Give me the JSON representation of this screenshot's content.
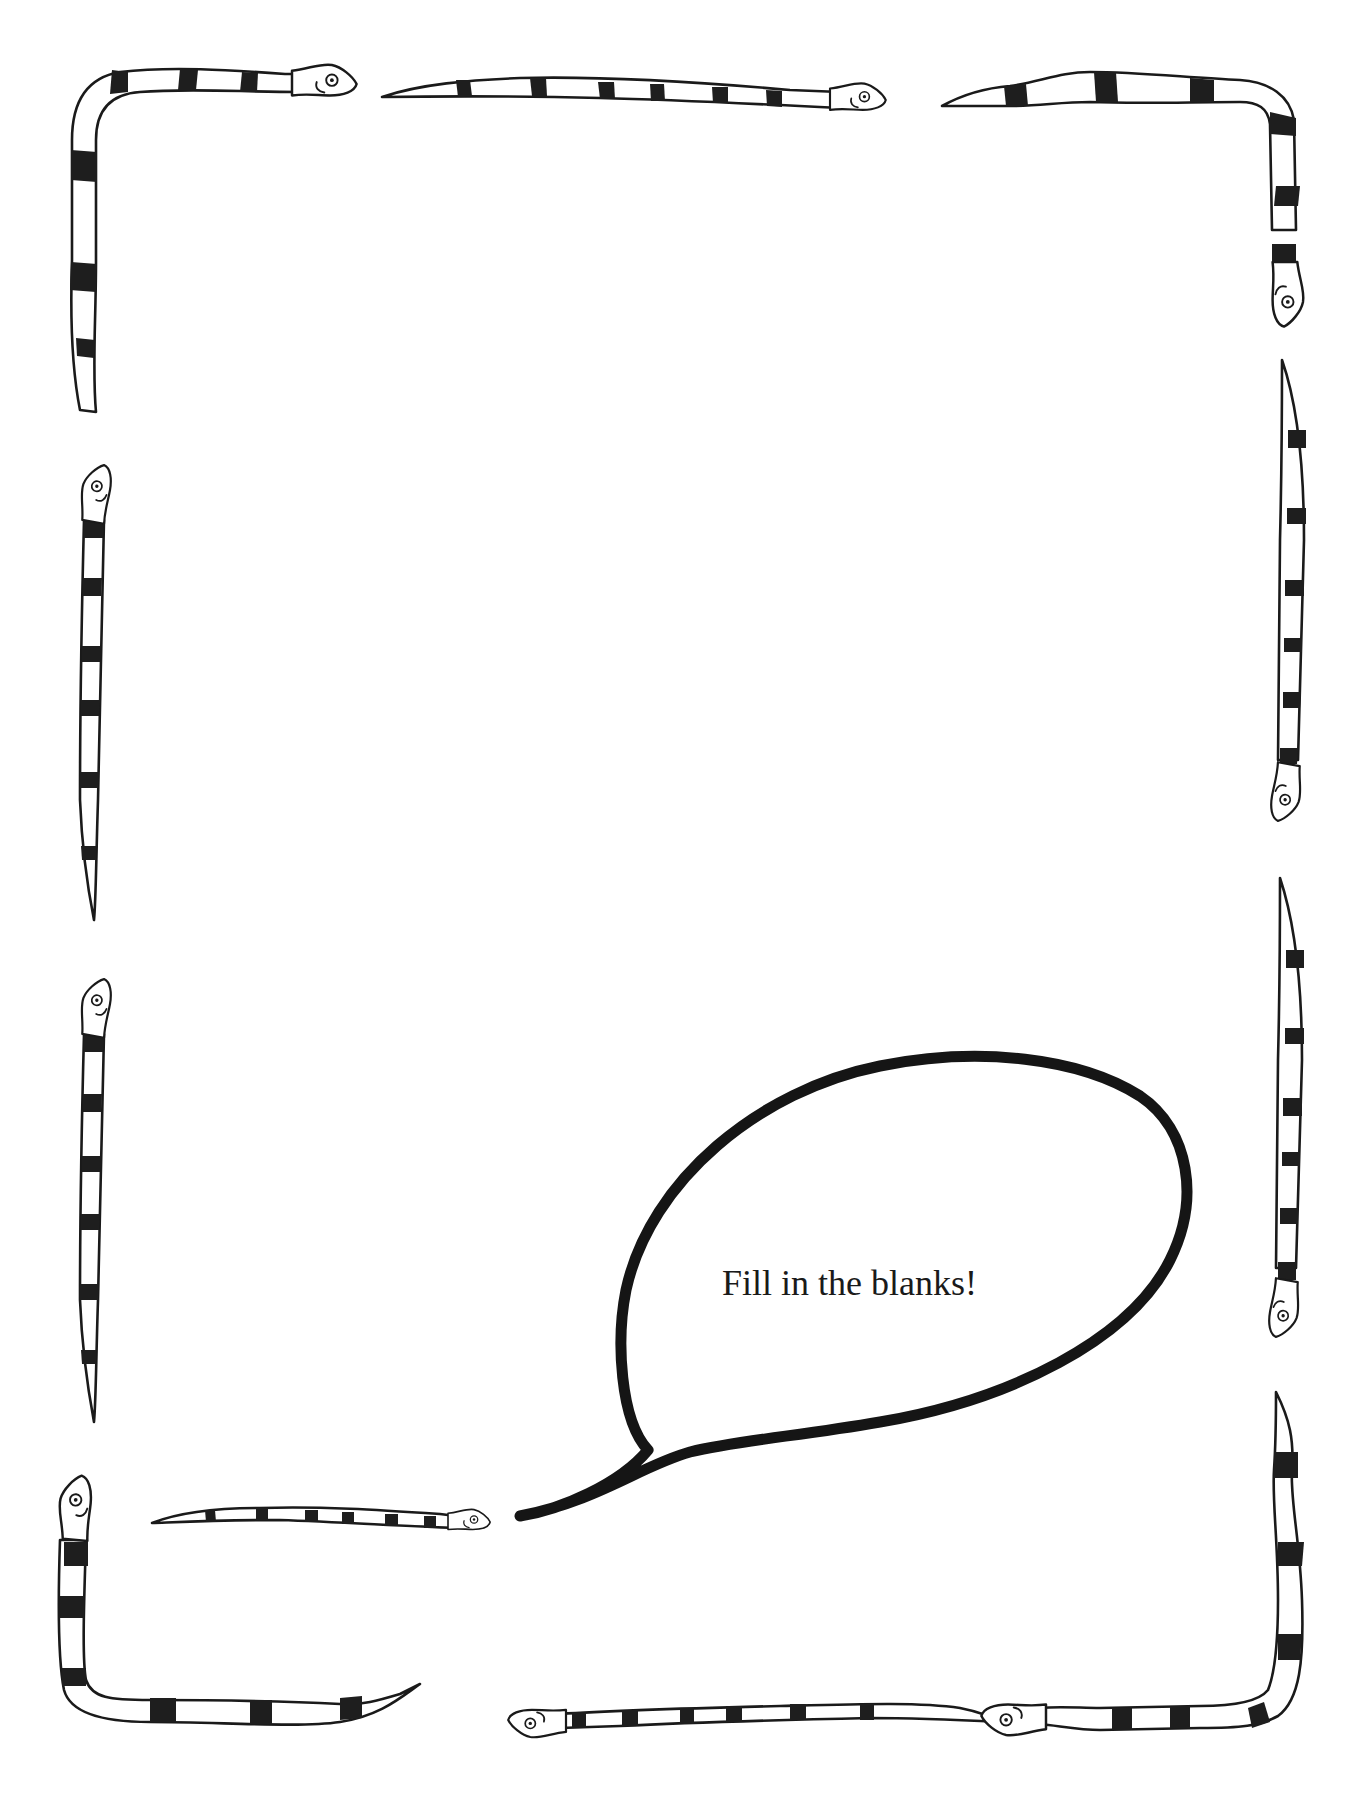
{
  "page": {
    "type": "worksheet",
    "border_theme": "striped snakes",
    "colors": {
      "ink": "#1a1a1a",
      "paper": "#ffffff"
    }
  },
  "speech_bubble": {
    "text": "Fill in the blanks!"
  },
  "decorations": {
    "snakes": [
      {
        "name": "top-left-corner-snake"
      },
      {
        "name": "top-middle-snake"
      },
      {
        "name": "top-right-corner-snake"
      },
      {
        "name": "left-upper-snake"
      },
      {
        "name": "left-lower-snake"
      },
      {
        "name": "right-upper-snake"
      },
      {
        "name": "right-lower-snake"
      },
      {
        "name": "bottom-left-corner-snake"
      },
      {
        "name": "bottom-inner-snake"
      },
      {
        "name": "bottom-middle-snake"
      },
      {
        "name": "bottom-right-corner-snake"
      }
    ]
  }
}
